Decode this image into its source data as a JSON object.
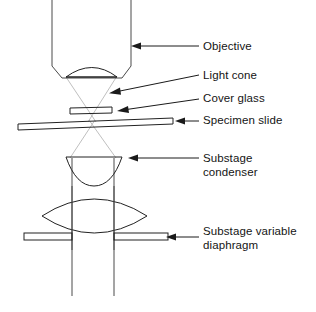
{
  "diagram": {
    "colors": {
      "lens_fill": "#d2d2d2",
      "glass_fill": "#ffffff",
      "outline": "#4a4a4a",
      "outline_dark": "#222222",
      "ray": "#b8b8b8",
      "leader": "#1a1a1a",
      "text": "#141414",
      "background": "#ffffff"
    },
    "labels": [
      {
        "id": "objective",
        "icon": "arrow-left-icon",
        "lines": [
          "Objective"
        ],
        "text_x": 203,
        "text_y": 50,
        "leader": {
          "x1": 199,
          "y1": 46,
          "x2": 134,
          "y2": 46
        },
        "arrow_tip": {
          "x": 131,
          "y": 46
        }
      },
      {
        "id": "light-cone",
        "icon": "arrow-left-icon",
        "lines": [
          "Light cone"
        ],
        "text_x": 203,
        "text_y": 79,
        "leader": {
          "x1": 199,
          "y1": 75,
          "x2": 113,
          "y2": 92
        },
        "arrow_tip": {
          "x": 109,
          "y": 93
        }
      },
      {
        "id": "cover-glass",
        "icon": "arrow-left-icon",
        "lines": [
          "Cover glass"
        ],
        "text_x": 203,
        "text_y": 102,
        "leader": {
          "x1": 199,
          "y1": 99,
          "x2": 121,
          "y2": 110
        },
        "arrow_tip": {
          "x": 117,
          "y": 111
        }
      },
      {
        "id": "specimen-slide",
        "icon": "arrow-left-icon",
        "lines": [
          "Specimen slide"
        ],
        "text_x": 203,
        "text_y": 124,
        "leader": {
          "x1": 199,
          "y1": 121,
          "x2": 178,
          "y2": 121
        },
        "arrow_tip": {
          "x": 175,
          "y": 121
        }
      },
      {
        "id": "substage-condenser",
        "icon": "arrow-left-icon",
        "lines": [
          "Substage",
          "condenser"
        ],
        "text_x": 203,
        "text_y": 162,
        "leader": {
          "x1": 199,
          "y1": 158,
          "x2": 131,
          "y2": 158
        },
        "arrow_tip": {
          "x": 128,
          "y": 158
        }
      },
      {
        "id": "substage-variable-diaphragm",
        "icon": "arrow-left-icon",
        "lines": [
          "Substage variable",
          "diaphragm"
        ],
        "text_x": 203,
        "text_y": 235,
        "leader": {
          "x1": 199,
          "y1": 237,
          "x2": 169,
          "y2": 237
        },
        "arrow_tip": {
          "x": 166,
          "y": 237
        }
      }
    ],
    "parts": [
      {
        "id": "objective-barrel",
        "name": "objective-barrel"
      },
      {
        "id": "objective-lens",
        "name": "objective-front-lens"
      },
      {
        "id": "light-cone-upper",
        "name": "upper-light-cone"
      },
      {
        "id": "light-cone-lower",
        "name": "lower-light-cone"
      },
      {
        "id": "cover-glass-piece",
        "name": "cover-glass"
      },
      {
        "id": "specimen-slide-bar",
        "name": "specimen-slide"
      },
      {
        "id": "condenser-top-lens",
        "name": "condenser-top-lens"
      },
      {
        "id": "condenser-barrel",
        "name": "condenser-barrel"
      },
      {
        "id": "condenser-main-lens",
        "name": "condenser-main-lens"
      },
      {
        "id": "diaphragm-left",
        "name": "diaphragm-left-blade"
      },
      {
        "id": "diaphragm-right",
        "name": "diaphragm-right-blade"
      }
    ]
  }
}
